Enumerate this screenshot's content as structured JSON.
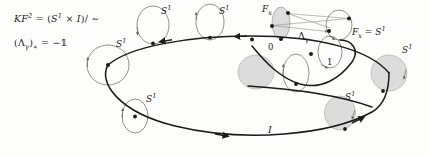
{
  "figure": {
    "title_equation_line1": "KF² = (S¹ × I)/ ∼",
    "title_equation_line2": "(Λγ)* = −1",
    "interval_label": "I",
    "monodromy_label": "Λ",
    "monodromy_sub": "γ",
    "endpoint_left": "0",
    "endpoint_right": "1",
    "fiber_label_left": "F",
    "fiber_label_left_sub": "x",
    "fiber_label_right": "F",
    "fiber_label_right_sub": "x",
    "fiber_label_right_eq": "= S",
    "fiber_exp": "1",
    "circle_labels": [
      {
        "text": "S",
        "exp": "1",
        "x": 161,
        "y": 8
      },
      {
        "text": "S",
        "exp": "1",
        "x": 219,
        "y": 8
      },
      {
        "text": "S",
        "exp": "1",
        "x": 116,
        "y": 41
      },
      {
        "text": "S",
        "exp": "1",
        "x": 142,
        "y": 96
      },
      {
        "text": "S",
        "exp": "1",
        "x": 340,
        "y": 93
      },
      {
        "text": "S",
        "exp": "1",
        "x": 400,
        "y": 45
      }
    ],
    "colors": {
      "ink": "#1b1b1b",
      "thin_stroke": "#6e6e6e",
      "fill_shade": "#d9d9d9",
      "background": "#fdfdfb"
    },
    "equation_pieces": {
      "K": "K",
      "F": "F",
      "F_exp": "2",
      "eq": "=",
      "open": "(",
      "S": "S",
      "S_exp": "1",
      "times": "×",
      "I": "I",
      "close_slash": ")/ ∼",
      "lambda_open": "(Λ",
      "lambda_sub": "γ",
      "lambda_close_star": ")",
      "star": "∗",
      "eq2": "=",
      "minus_one": "−𝟙"
    }
  }
}
